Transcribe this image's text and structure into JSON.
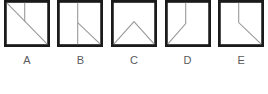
{
  "panel": {
    "name": "multiple-choice-figure-options",
    "background_color": "#ffffff",
    "border_color": "#1a1a1a",
    "inner_line_color": "#9a9a9a",
    "label_color": "#5a5a5a"
  },
  "options": [
    {
      "label": "A",
      "figure_name": "square-with-diagonal-and-top-stub",
      "description": "Square outline with a diagonal line from the top-left corner to the bottom-right corner, and a short vertical line descending from the top edge to meet the diagonal.",
      "strokes": [
        {
          "type": "line",
          "name": "main-diagonal",
          "x1": 0,
          "y1": 0,
          "x2": 100,
          "y2": 100
        },
        {
          "type": "line",
          "name": "top-vertical-stub",
          "x1": 45,
          "y1": 0,
          "x2": 45,
          "y2": 45
        }
      ]
    },
    {
      "label": "B",
      "figure_name": "square-with-full-vertical-and-lower-right-diagonal",
      "description": "Square outline with a full-height vertical line left of center, and a diagonal from the midpoint of that vertical line down to the bottom-right corner.",
      "strokes": [
        {
          "type": "line",
          "name": "full-vertical",
          "x1": 45,
          "y1": 0,
          "x2": 45,
          "y2": 100
        },
        {
          "type": "line",
          "name": "lower-right-diagonal",
          "x1": 45,
          "y1": 48,
          "x2": 100,
          "y2": 100
        }
      ]
    },
    {
      "label": "C",
      "figure_name": "square-with-chevron-peak",
      "description": "Square outline containing a chevron: two diagonals rising from the bottom-left and bottom-right corners to meet at an apex near the center.",
      "strokes": [
        {
          "type": "line",
          "name": "chevron-left-leg",
          "x1": 0,
          "y1": 100,
          "x2": 50,
          "y2": 46
        },
        {
          "type": "line",
          "name": "chevron-right-leg",
          "x1": 50,
          "y1": 46,
          "x2": 100,
          "y2": 100
        }
      ]
    },
    {
      "label": "D",
      "figure_name": "square-with-vertical-and-lower-left-diagonal",
      "description": "Square outline with a vertical line from the top edge down to mid-height, then a diagonal continuing down-left to the bottom-left corner.",
      "strokes": [
        {
          "type": "line",
          "name": "top-vertical",
          "x1": 45,
          "y1": 0,
          "x2": 45,
          "y2": 50
        },
        {
          "type": "line",
          "name": "lower-left-diagonal",
          "x1": 45,
          "y1": 50,
          "x2": 0,
          "y2": 100
        }
      ]
    },
    {
      "label": "E",
      "figure_name": "square-with-vertical-and-lower-right-diagonal",
      "description": "Square outline with a vertical line from the top edge down to mid-height, then a diagonal continuing down-right to the bottom-right corner.",
      "strokes": [
        {
          "type": "line",
          "name": "top-vertical",
          "x1": 45,
          "y1": 0,
          "x2": 45,
          "y2": 48
        },
        {
          "type": "line",
          "name": "lower-right-diagonal",
          "x1": 45,
          "y1": 48,
          "x2": 100,
          "y2": 100
        }
      ]
    }
  ]
}
